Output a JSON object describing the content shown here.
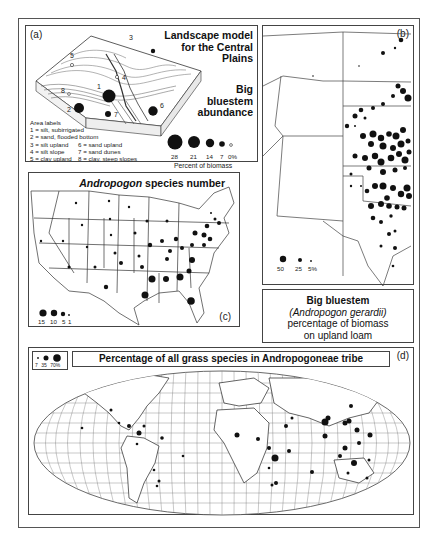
{
  "panel_a": {
    "label": "(a)",
    "title_lines": [
      "Landscape model",
      "for the Central",
      "Plains"
    ],
    "subtitle_lines": [
      "Big",
      "bluestem",
      "abundance"
    ],
    "area_labels_heading": "Area labels",
    "area_labels": [
      "1 = silt, subirrigated",
      "2 = sand, flooded bottom",
      "3 = silt upland",
      "4 = silt slope",
      "5 = clay upland",
      "6 = sand upland",
      "7 = sand dunes",
      "8 = clay, steep slopes"
    ],
    "site_numbers": [
      "1",
      "2",
      "3",
      "4",
      "5",
      "6",
      "7",
      "8"
    ],
    "legend_values": [
      "28",
      "21",
      "14",
      "7",
      "0%"
    ],
    "legend_caption": "Percent of biomass"
  },
  "panel_b": {
    "label": "(b)",
    "legend_values": [
      "50",
      "25",
      "5%"
    ],
    "caption_title": "Big bluestem",
    "caption_species": "(Andropogon gerardii)",
    "caption_line3": "percentage of biomass",
    "caption_line4": "on upland loam"
  },
  "panel_c": {
    "label": "(c)",
    "title_italic": "Andropogon",
    "title_rest": " species number",
    "legend_values": [
      "15",
      "10",
      "5",
      "1"
    ]
  },
  "panel_d": {
    "label": "(d)",
    "title": "Percentage of all grass species in Andropogoneae tribe",
    "legend_values": [
      "7",
      "35",
      "70%"
    ]
  }
}
